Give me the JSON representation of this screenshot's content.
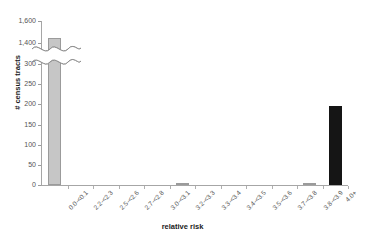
{
  "chart_data": {
    "type": "bar",
    "title": "",
    "xlabel": "relative risk",
    "ylabel": "# census tracts",
    "categories": [
      "0.0-<0.1",
      "2.2-<2.3",
      "2.5-<2.6",
      "2.7-<2.8",
      "3.0-<3.1",
      "3.2-<3.3",
      "3.3-<3.4",
      "3.4-<3.5",
      "3.5-<3.6",
      "3.7-<3.8",
      "3.8-<3.9",
      "4.0+"
    ],
    "values": [
      1450,
      0,
      0,
      0,
      0,
      4,
      0,
      0,
      0,
      0,
      4,
      195
    ],
    "ylim": [
      0,
      1600
    ],
    "ytick_labels": [
      "0",
      "50",
      "100",
      "150",
      "200",
      "250",
      "300",
      "1,400",
      "1,600"
    ],
    "ytick_values": [
      0,
      50,
      100,
      150,
      200,
      250,
      300,
      1400,
      1600
    ],
    "axis_break": {
      "present": true,
      "between_lower": 300,
      "between_upper": 1400
    },
    "grid": false,
    "legend": "none",
    "bar_colors": {
      "default": "#c6c6c6",
      "default_border": "#9b9b9b",
      "highlight": "#151515"
    },
    "highlight_category": "4.0+",
    "axis_color": "#a6a6a6",
    "tick_text_color": "#555555",
    "title_text_color": "#1a1a1a"
  }
}
